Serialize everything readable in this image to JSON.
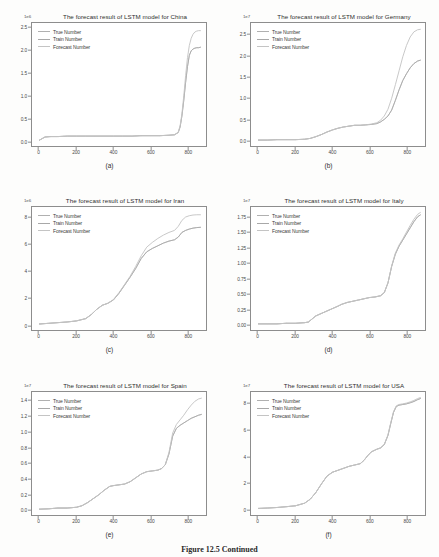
{
  "figure": {
    "caption_label": "Figure 12.5",
    "caption_text": "Continued",
    "legend": [
      "True Number",
      "Train Number",
      "Forecast Number"
    ],
    "line_colors": [
      "#b0b0b0",
      "#a8a8a8",
      "#c4c4c4"
    ],
    "axis_color": "#8d8d8d"
  },
  "chart_data": [
    {
      "type": "line",
      "panel": "(a)",
      "title": "The forecast result of LSTM model for China",
      "xlabel": "",
      "ylabel": "",
      "yexponent": "1e6",
      "xlim": [
        -40,
        900
      ],
      "ylim": [
        -0.12,
        2.62
      ],
      "xticks": [
        0,
        200,
        400,
        600,
        800
      ],
      "yticks": [
        0.0,
        0.5,
        1.0,
        1.5,
        2.0,
        2.5
      ],
      "ytick_labels": [
        "0.0",
        "0.5",
        "1.0",
        "1.5",
        "2.0",
        "2.5"
      ],
      "xtick_labels": [
        "0",
        "200",
        "400",
        "600",
        "800"
      ],
      "grid": false,
      "legend_position": "upper left",
      "x": [
        0,
        30,
        60,
        100,
        150,
        200,
        250,
        300,
        350,
        400,
        450,
        500,
        550,
        600,
        650,
        700,
        730,
        750,
        760,
        770,
        780,
        790,
        800,
        810,
        820,
        830,
        840,
        850,
        860,
        870
      ],
      "series": [
        {
          "name": "True Number",
          "values": [
            0.01,
            0.08,
            0.09,
            0.09,
            0.1,
            0.1,
            0.1,
            0.1,
            0.1,
            0.1,
            0.1,
            0.1,
            0.11,
            0.11,
            0.11,
            0.12,
            0.13,
            0.18,
            0.3,
            0.55,
            0.9,
            1.3,
            1.65,
            1.9,
            2.0,
            2.04,
            2.06,
            2.07,
            2.07,
            2.08
          ]
        },
        {
          "name": "Train Number",
          "values": [
            0.01,
            0.08,
            0.09,
            0.09,
            0.1,
            0.1,
            0.1,
            0.1,
            0.1,
            0.1,
            0.1,
            0.1,
            0.11,
            0.11,
            0.11,
            0.12,
            0.13,
            0.18,
            0.3,
            0.55,
            0.9,
            1.3,
            1.65,
            1.9,
            2.0,
            2.04,
            2.06,
            2.07,
            2.07,
            2.08
          ]
        },
        {
          "name": "Forecast Number",
          "values": [
            0.01,
            0.08,
            0.09,
            0.09,
            0.1,
            0.1,
            0.1,
            0.1,
            0.1,
            0.1,
            0.1,
            0.1,
            0.11,
            0.11,
            0.11,
            0.12,
            0.13,
            0.19,
            0.33,
            0.6,
            1.0,
            1.45,
            1.85,
            2.12,
            2.28,
            2.37,
            2.42,
            2.44,
            2.45,
            2.45
          ]
        }
      ]
    },
    {
      "type": "line",
      "panel": "(b)",
      "title": "The forecast result of LSTM model for Germany",
      "xlabel": "",
      "ylabel": "",
      "yexponent": "1e7",
      "xlim": [
        -40,
        900
      ],
      "ylim": [
        -0.13,
        2.78
      ],
      "xticks": [
        0,
        200,
        400,
        600,
        800
      ],
      "yticks": [
        0.0,
        0.5,
        1.0,
        1.5,
        2.0,
        2.5
      ],
      "ytick_labels": [
        "0.0",
        "0.5",
        "1.0",
        "1.5",
        "2.0",
        "2.5"
      ],
      "xtick_labels": [
        "0",
        "200",
        "400",
        "600",
        "800"
      ],
      "grid": false,
      "legend_position": "upper left",
      "x": [
        0,
        50,
        100,
        150,
        200,
        250,
        280,
        310,
        340,
        370,
        400,
        430,
        460,
        490,
        520,
        550,
        580,
        610,
        640,
        660,
        680,
        700,
        720,
        740,
        760,
        780,
        800,
        820,
        840,
        860,
        875
      ],
      "series": [
        {
          "name": "True Number",
          "values": [
            0.01,
            0.01,
            0.02,
            0.02,
            0.02,
            0.03,
            0.05,
            0.09,
            0.14,
            0.2,
            0.25,
            0.29,
            0.32,
            0.34,
            0.36,
            0.36,
            0.37,
            0.38,
            0.4,
            0.44,
            0.5,
            0.58,
            0.72,
            0.95,
            1.2,
            1.42,
            1.58,
            1.72,
            1.82,
            1.88,
            1.9
          ]
        },
        {
          "name": "Train Number",
          "values": [
            0.01,
            0.01,
            0.02,
            0.02,
            0.02,
            0.03,
            0.05,
            0.09,
            0.14,
            0.2,
            0.25,
            0.29,
            0.32,
            0.34,
            0.36,
            0.36,
            0.37,
            0.38,
            0.4,
            0.44,
            0.5,
            0.58,
            0.72,
            0.95,
            1.2,
            1.42,
            1.58,
            1.72,
            1.82,
            1.88,
            1.9
          ]
        },
        {
          "name": "Forecast Number",
          "values": [
            0.01,
            0.01,
            0.02,
            0.02,
            0.02,
            0.03,
            0.05,
            0.09,
            0.14,
            0.2,
            0.25,
            0.29,
            0.32,
            0.34,
            0.36,
            0.36,
            0.37,
            0.39,
            0.42,
            0.48,
            0.58,
            0.74,
            1.0,
            1.32,
            1.65,
            1.98,
            2.25,
            2.45,
            2.57,
            2.62,
            2.63
          ]
        }
      ]
    },
    {
      "type": "line",
      "panel": "(c)",
      "title": "The forecast result of LSTM model for Iran",
      "xlabel": "",
      "ylabel": "",
      "yexponent": "1e6",
      "xlim": [
        -40,
        900
      ],
      "ylim": [
        -0.4,
        8.8
      ],
      "xticks": [
        0,
        200,
        400,
        600,
        800
      ],
      "yticks": [
        0,
        2,
        4,
        6,
        8
      ],
      "ytick_labels": [
        "0",
        "2",
        "4",
        "6",
        "8"
      ],
      "xtick_labels": [
        "0",
        "200",
        "400",
        "600",
        "800"
      ],
      "grid": false,
      "legend_position": "upper left",
      "x": [
        0,
        50,
        100,
        150,
        200,
        250,
        280,
        310,
        340,
        370,
        400,
        430,
        460,
        490,
        520,
        550,
        580,
        610,
        640,
        670,
        700,
        730,
        750,
        770,
        790,
        810,
        830,
        850,
        870
      ],
      "series": [
        {
          "name": "True Number",
          "values": [
            0.05,
            0.1,
            0.15,
            0.2,
            0.28,
            0.45,
            0.75,
            1.15,
            1.45,
            1.6,
            1.85,
            2.35,
            2.95,
            3.55,
            4.2,
            4.95,
            5.45,
            5.7,
            5.9,
            6.1,
            6.25,
            6.35,
            6.55,
            6.9,
            7.05,
            7.15,
            7.22,
            7.26,
            7.28
          ]
        },
        {
          "name": "Train Number",
          "values": [
            0.05,
            0.1,
            0.15,
            0.2,
            0.28,
            0.45,
            0.75,
            1.15,
            1.45,
            1.6,
            1.85,
            2.35,
            2.95,
            3.55,
            4.2,
            4.95,
            5.45,
            5.7,
            5.9,
            6.1,
            6.25,
            6.35,
            6.55,
            6.9,
            7.05,
            7.15,
            7.22,
            7.26,
            7.28
          ]
        },
        {
          "name": "Forecast Number",
          "values": [
            0.05,
            0.1,
            0.15,
            0.2,
            0.28,
            0.45,
            0.75,
            1.15,
            1.45,
            1.6,
            1.88,
            2.4,
            3.0,
            3.62,
            4.35,
            5.15,
            5.8,
            6.15,
            6.45,
            6.7,
            6.9,
            7.05,
            7.35,
            7.8,
            8.05,
            8.15,
            8.2,
            8.22,
            8.22
          ]
        }
      ]
    },
    {
      "type": "line",
      "panel": "(d)",
      "title": "The forecast result of LSTM model for Italy",
      "xlabel": "",
      "ylabel": "",
      "yexponent": "1e7",
      "xlim": [
        -40,
        900
      ],
      "ylim": [
        -0.09,
        1.92
      ],
      "xticks": [
        0,
        200,
        400,
        600,
        800
      ],
      "yticks": [
        0.0,
        0.25,
        0.5,
        0.75,
        1.0,
        1.25,
        1.5,
        1.75
      ],
      "ytick_labels": [
        "0.00",
        "0.25",
        "0.50",
        "0.75",
        "1.00",
        "1.25",
        "1.50",
        "1.75"
      ],
      "xtick_labels": [
        "0",
        "200",
        "400",
        "600",
        "800"
      ],
      "grid": false,
      "legend_position": "upper left",
      "x": [
        0,
        50,
        100,
        150,
        200,
        250,
        270,
        290,
        310,
        340,
        370,
        400,
        430,
        450,
        480,
        510,
        540,
        570,
        600,
        630,
        660,
        680,
        700,
        720,
        740,
        760,
        780,
        800,
        820,
        840,
        860,
        875
      ],
      "series": [
        {
          "name": "True Number",
          "values": [
            0.01,
            0.01,
            0.01,
            0.02,
            0.02,
            0.03,
            0.04,
            0.09,
            0.14,
            0.18,
            0.22,
            0.26,
            0.3,
            0.33,
            0.36,
            0.38,
            0.4,
            0.42,
            0.44,
            0.45,
            0.47,
            0.52,
            0.68,
            0.95,
            1.15,
            1.28,
            1.38,
            1.48,
            1.58,
            1.68,
            1.76,
            1.79
          ]
        },
        {
          "name": "Train Number",
          "values": [
            0.01,
            0.01,
            0.01,
            0.02,
            0.02,
            0.03,
            0.04,
            0.09,
            0.14,
            0.18,
            0.22,
            0.26,
            0.3,
            0.33,
            0.36,
            0.38,
            0.4,
            0.42,
            0.44,
            0.45,
            0.47,
            0.52,
            0.68,
            0.95,
            1.15,
            1.28,
            1.38,
            1.48,
            1.58,
            1.68,
            1.76,
            1.79
          ]
        },
        {
          "name": "Forecast Number",
          "values": [
            0.01,
            0.01,
            0.01,
            0.02,
            0.02,
            0.03,
            0.04,
            0.09,
            0.14,
            0.18,
            0.22,
            0.26,
            0.3,
            0.33,
            0.36,
            0.38,
            0.4,
            0.42,
            0.44,
            0.45,
            0.47,
            0.52,
            0.68,
            0.96,
            1.17,
            1.3,
            1.4,
            1.51,
            1.62,
            1.72,
            1.8,
            1.83
          ]
        }
      ]
    },
    {
      "type": "line",
      "panel": "(e)",
      "title": "The forecast result of LSTM model for Spain",
      "xlabel": "",
      "ylabel": "",
      "yexponent": "1e7",
      "xlim": [
        -40,
        900
      ],
      "ylim": [
        -0.07,
        1.52
      ],
      "xticks": [
        0,
        200,
        400,
        600,
        800
      ],
      "yticks": [
        0.0,
        0.2,
        0.4,
        0.6,
        0.8,
        1.0,
        1.2,
        1.4
      ],
      "ytick_labels": [
        "0.0",
        "0.2",
        "0.4",
        "0.6",
        "0.8",
        "1.0",
        "1.2",
        "1.4"
      ],
      "xtick_labels": [
        "0",
        "200",
        "400",
        "600",
        "800"
      ],
      "grid": false,
      "legend_position": "upper left",
      "x": [
        0,
        50,
        100,
        150,
        200,
        230,
        260,
        290,
        320,
        350,
        380,
        400,
        430,
        460,
        490,
        520,
        550,
        580,
        610,
        640,
        660,
        680,
        700,
        720,
        740,
        760,
        780,
        800,
        820,
        840,
        860,
        875
      ],
      "series": [
        {
          "name": "True Number",
          "values": [
            0.005,
            0.01,
            0.02,
            0.02,
            0.03,
            0.05,
            0.09,
            0.14,
            0.19,
            0.25,
            0.3,
            0.31,
            0.32,
            0.33,
            0.36,
            0.41,
            0.46,
            0.49,
            0.5,
            0.51,
            0.53,
            0.58,
            0.72,
            0.95,
            1.05,
            1.09,
            1.12,
            1.15,
            1.18,
            1.2,
            1.22,
            1.23
          ]
        },
        {
          "name": "Train Number",
          "values": [
            0.005,
            0.01,
            0.02,
            0.02,
            0.03,
            0.05,
            0.09,
            0.14,
            0.19,
            0.25,
            0.3,
            0.31,
            0.32,
            0.33,
            0.36,
            0.41,
            0.46,
            0.49,
            0.5,
            0.51,
            0.53,
            0.58,
            0.72,
            0.95,
            1.05,
            1.09,
            1.12,
            1.15,
            1.18,
            1.2,
            1.22,
            1.23
          ]
        },
        {
          "name": "Forecast Number",
          "values": [
            0.005,
            0.01,
            0.02,
            0.02,
            0.03,
            0.05,
            0.09,
            0.14,
            0.19,
            0.25,
            0.3,
            0.31,
            0.32,
            0.33,
            0.36,
            0.41,
            0.46,
            0.49,
            0.5,
            0.51,
            0.53,
            0.58,
            0.74,
            0.99,
            1.1,
            1.16,
            1.22,
            1.29,
            1.35,
            1.4,
            1.43,
            1.44
          ]
        }
      ]
    },
    {
      "type": "line",
      "panel": "(f)",
      "title": "The forecast result of LSTM model for USA",
      "xlabel": "",
      "ylabel": "",
      "yexponent": "1e7",
      "xlim": [
        -40,
        900
      ],
      "ylim": [
        -0.45,
        8.9
      ],
      "xticks": [
        0,
        200,
        400,
        600,
        800
      ],
      "yticks": [
        0,
        2,
        4,
        6,
        8
      ],
      "ytick_labels": [
        "0",
        "2",
        "4",
        "6",
        "8"
      ],
      "xtick_labels": [
        "0",
        "200",
        "400",
        "600",
        "800"
      ],
      "grid": false,
      "legend_position": "upper left",
      "x": [
        0,
        50,
        100,
        150,
        200,
        250,
        280,
        310,
        340,
        370,
        400,
        430,
        460,
        490,
        520,
        550,
        570,
        590,
        610,
        640,
        660,
        680,
        700,
        715,
        730,
        745,
        760,
        780,
        800,
        820,
        840,
        860,
        875
      ],
      "series": [
        {
          "name": "True Number",
          "values": [
            0.05,
            0.08,
            0.12,
            0.18,
            0.25,
            0.45,
            0.75,
            1.25,
            1.9,
            2.5,
            2.8,
            2.95,
            3.1,
            3.25,
            3.35,
            3.45,
            3.7,
            4.05,
            4.35,
            4.55,
            4.65,
            4.9,
            5.6,
            6.5,
            7.35,
            7.8,
            7.9,
            7.95,
            8.0,
            8.08,
            8.18,
            8.32,
            8.4
          ]
        },
        {
          "name": "Train Number",
          "values": [
            0.05,
            0.08,
            0.12,
            0.18,
            0.25,
            0.45,
            0.75,
            1.25,
            1.9,
            2.5,
            2.8,
            2.95,
            3.1,
            3.25,
            3.35,
            3.45,
            3.7,
            4.05,
            4.35,
            4.55,
            4.65,
            4.9,
            5.6,
            6.5,
            7.35,
            7.8,
            7.9,
            7.95,
            8.0,
            8.08,
            8.18,
            8.32,
            8.4
          ]
        },
        {
          "name": "Forecast Number",
          "values": [
            0.05,
            0.08,
            0.12,
            0.18,
            0.25,
            0.45,
            0.75,
            1.25,
            1.9,
            2.5,
            2.8,
            2.95,
            3.1,
            3.25,
            3.35,
            3.45,
            3.7,
            4.05,
            4.35,
            4.55,
            4.65,
            4.92,
            5.65,
            6.58,
            7.42,
            7.85,
            7.95,
            8.0,
            8.06,
            8.15,
            8.26,
            8.4,
            8.48
          ]
        }
      ]
    }
  ]
}
